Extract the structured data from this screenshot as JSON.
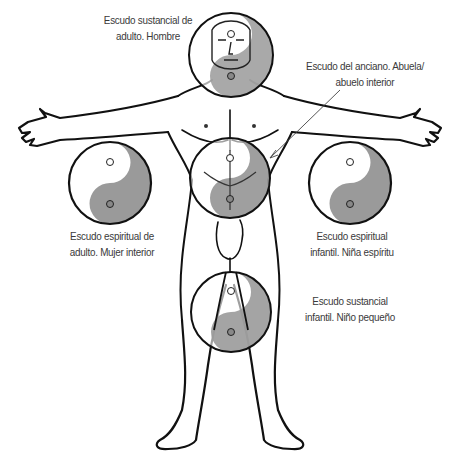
{
  "colors": {
    "shade": "#9a9a9a",
    "outline": "#111111",
    "text": "#3a3a3a",
    "background": "#ffffff"
  },
  "labels": {
    "head": {
      "line1": "Escudo sustancial de",
      "line2": "adulto. Hombre"
    },
    "elder": {
      "line1": "Escudo del anciano. Abuela/",
      "line2": "abuelo interior"
    },
    "left": {
      "line1": "Escudo espiritual de",
      "line2": "adulto. Mujer interior"
    },
    "right": {
      "line1": "Escudo espiritual",
      "line2": "infantil. Niña espíritu"
    },
    "bottom": {
      "line1": "Escudo sustancial",
      "line2": "infantil. Niño pequeño"
    }
  },
  "shields": [
    {
      "id": "head",
      "cx": 231,
      "cy": 55,
      "r": 42
    },
    {
      "id": "belly",
      "cx": 230,
      "cy": 178,
      "r": 40
    },
    {
      "id": "left",
      "cx": 110,
      "cy": 183,
      "r": 41
    },
    {
      "id": "right",
      "cx": 350,
      "cy": 183,
      "r": 41
    },
    {
      "id": "groin",
      "cx": 231,
      "cy": 312,
      "r": 40
    }
  ]
}
